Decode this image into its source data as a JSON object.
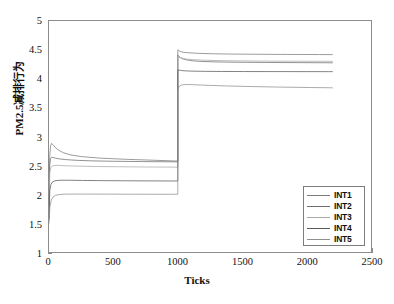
{
  "chart_data": {
    "type": "line",
    "title": "",
    "xlabel": "Ticks",
    "ylabel": "PM2.5减排行为",
    "xlim": [
      0,
      2500
    ],
    "ylim": [
      1,
      5
    ],
    "xticks": [
      0,
      500,
      1000,
      1500,
      2000,
      2500
    ],
    "yticks": [
      1,
      1.5,
      2,
      2.5,
      3,
      3.5,
      4,
      4.5,
      5
    ],
    "xtick_labels": [
      "0",
      "500",
      "1000",
      "1500",
      "2000",
      "2500"
    ],
    "ytick_labels": [
      "1",
      "1.5",
      "2",
      "2.5",
      "3",
      "3.5",
      "4",
      "4.5",
      "5"
    ],
    "grid": false,
    "legend_position": "lower right",
    "legend_entries": [
      "INT1",
      "INT2",
      "INT3",
      "INT4",
      "INT5"
    ],
    "annotations": [
      "Step change in all series at x = 1000 ticks",
      "Series terminate at x = 2200 ticks"
    ],
    "series": [
      {
        "name": "INT1",
        "color": "#7b7b7b",
        "x": [
          0,
          5,
          12,
          20,
          30,
          45,
          70,
          110,
          170,
          260,
          400,
          600,
          800,
          1000,
          1000,
          1003,
          1008,
          1016,
          1030,
          1055,
          1095,
          1160,
          1260,
          1400,
          1600,
          1850,
          2100,
          2200
        ],
        "y": [
          1.58,
          2.64,
          2.84,
          2.88,
          2.86,
          2.82,
          2.77,
          2.72,
          2.68,
          2.65,
          2.625,
          2.605,
          2.59,
          2.575,
          4.5,
          4.5,
          4.49,
          4.475,
          4.465,
          4.455,
          4.448,
          4.44,
          4.433,
          4.428,
          4.424,
          4.421,
          4.419,
          4.418
        ]
      },
      {
        "name": "INT2",
        "color": "#6e6e6e",
        "x": [
          0,
          5,
          12,
          20,
          32,
          50,
          80,
          130,
          210,
          330,
          500,
          720,
          900,
          1000,
          1000,
          1004,
          1010,
          1020,
          1038,
          1065,
          1110,
          1180,
          1290,
          1450,
          1680,
          1950,
          2150,
          2200
        ],
        "y": [
          1.6,
          2.5,
          2.62,
          2.64,
          2.635,
          2.625,
          2.612,
          2.6,
          2.588,
          2.578,
          2.571,
          2.566,
          2.563,
          2.561,
          4.41,
          4.4,
          4.385,
          4.365,
          4.345,
          4.328,
          4.312,
          4.3,
          4.292,
          4.286,
          4.282,
          4.279,
          4.277,
          4.276
        ]
      },
      {
        "name": "INT3",
        "color": "#a8a8a8",
        "x": [
          0,
          6,
          14,
          25,
          40,
          62,
          95,
          150,
          240,
          370,
          550,
          760,
          920,
          1000,
          1000,
          1005,
          1012,
          1024,
          1044,
          1075,
          1125,
          1200,
          1320,
          1490,
          1720,
          1980,
          2160,
          2200
        ],
        "y": [
          1.62,
          2.38,
          2.46,
          2.49,
          2.497,
          2.5,
          2.497,
          2.492,
          2.486,
          2.48,
          2.476,
          2.472,
          2.47,
          2.469,
          4.385,
          4.38,
          4.372,
          4.362,
          4.35,
          4.34,
          4.33,
          4.321,
          4.314,
          4.309,
          4.305,
          4.303,
          4.302,
          4.301
        ]
      },
      {
        "name": "INT4",
        "color": "#5a5a5a",
        "x": [
          0,
          6,
          15,
          28,
          45,
          70,
          108,
          165,
          260,
          395,
          580,
          790,
          940,
          1000,
          1000,
          1006,
          1014,
          1028,
          1050,
          1082,
          1135,
          1215,
          1340,
          1510,
          1740,
          2000,
          2170,
          2200
        ],
        "y": [
          1.56,
          2.06,
          2.17,
          2.215,
          2.232,
          2.24,
          2.243,
          2.242,
          2.239,
          2.236,
          2.233,
          2.231,
          2.23,
          2.229,
          4.155,
          4.152,
          4.148,
          4.143,
          4.138,
          4.134,
          4.131,
          4.128,
          4.126,
          4.125,
          4.124,
          4.1235,
          4.123,
          4.123
        ]
      },
      {
        "name": "INT5",
        "color": "#8f8f8f",
        "x": [
          0,
          7,
          18,
          32,
          52,
          80,
          122,
          185,
          285,
          430,
          620,
          830,
          960,
          1000,
          1000,
          1008,
          1018,
          1034,
          1058,
          1095,
          1152,
          1240,
          1370,
          1545,
          1780,
          2030,
          2180,
          2200
        ],
        "y": [
          1.5,
          1.78,
          1.9,
          1.955,
          1.982,
          1.995,
          2.001,
          2.003,
          2.003,
          2.002,
          2.001,
          2.0,
          2.0,
          2.0,
          3.8,
          3.855,
          3.882,
          3.895,
          3.9,
          3.899,
          3.894,
          3.886,
          3.876,
          3.866,
          3.856,
          3.848,
          3.844,
          3.843
        ]
      }
    ]
  },
  "axes": {
    "x_title": "Ticks",
    "y_title": "PM2.5减排行为"
  },
  "legend": {
    "items": [
      {
        "label": "INT1",
        "color": "#7b7b7b"
      },
      {
        "label": "INT2",
        "color": "#6e6e6e"
      },
      {
        "label": "INT3",
        "color": "#a8a8a8"
      },
      {
        "label": "INT4",
        "color": "#5a5a5a"
      },
      {
        "label": "INT5",
        "color": "#8f8f8f"
      }
    ]
  }
}
